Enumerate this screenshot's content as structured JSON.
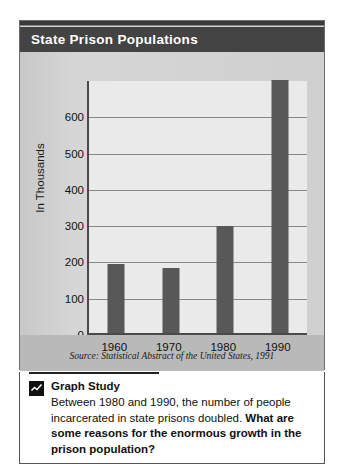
{
  "figure": {
    "title": "State Prison Populations",
    "source_note": "Source: Statistical Abstract of the United States, 1991"
  },
  "chart_data": {
    "type": "bar",
    "title": "State Prison Populations",
    "categories": [
      "1960",
      "1970",
      "1980",
      "1990"
    ],
    "values": [
      190,
      178,
      295,
      698
    ],
    "xlabel": "",
    "ylabel": "In Thousands",
    "ylim": [
      0,
      700
    ],
    "yticks": [
      0,
      100,
      200,
      300,
      400,
      500,
      600
    ],
    "ytick_labels": [
      "0",
      "100",
      "200",
      "300",
      "400",
      "500",
      "600"
    ],
    "grid": true,
    "legend": false,
    "bar_color": "#585858",
    "plot_background": "#eaeaea",
    "source": "Source: Statistical Abstract of the United States, 1991"
  },
  "study": {
    "icon": "line-chart-icon",
    "heading": "Graph Study",
    "body_plain": "Between 1980 and 1990, the number of people incarcerated in state prisons doubled. ",
    "body_bold": "What are some reasons for the enormous growth in the prison population?"
  },
  "colors": {
    "title_bar": "#434343",
    "frame": "#6e6e6e",
    "bar": "#585858",
    "grid": "#888888",
    "axis": "#4a4a4a"
  }
}
